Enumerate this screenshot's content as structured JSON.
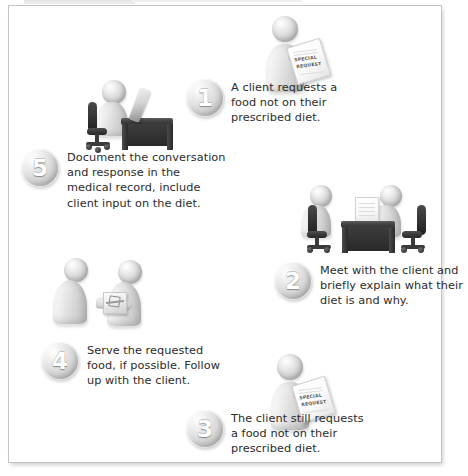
{
  "figure_tab": {
    "label": "",
    "visible_note": "partially cropped gray caption tab at top edge"
  },
  "diagram": {
    "type": "5-step cyclical process flow",
    "background_color": "#ffffff",
    "border_color": "#c4c4c4",
    "accent_color": "#b9b9b9",
    "text_color": "#2b2b2b",
    "steps": [
      {
        "number": "1",
        "text": "A client requests a food not on their prescribed diet.",
        "lines": [
          "A client requests a",
          "food not on their",
          "prescribed diet."
        ],
        "artwork": "standing-person-holding-special-request-note"
      },
      {
        "number": "2",
        "text": "Meet with the client and briefly explain what their diet is and why.",
        "lines": [
          "Meet with the client and",
          "briefly explain what their",
          "diet is and why."
        ],
        "artwork": "two-people-meeting-at-desk-with-papers"
      },
      {
        "number": "3",
        "text": "The client still requests a food not on their prescribed diet.",
        "lines": [
          "The client still requests",
          "a food not on their",
          "prescribed diet."
        ],
        "artwork": "standing-person-holding-special-request-note"
      },
      {
        "number": "4",
        "text": "Serve the requested food, if possible. Follow up with the client.",
        "lines": [
          "Serve the requested",
          "food, if possible. Follow",
          "up with the client."
        ],
        "artwork": "two-people-exchanging-food-tray"
      },
      {
        "number": "5",
        "text": "Document the conversation and response in the medical record, include client input on the diet.",
        "lines": [
          "Document the conversation",
          "and response in the",
          "medical record, include",
          "client input on the diet."
        ],
        "artwork": "person-at-desk-with-computer"
      }
    ],
    "note_label": {
      "line1": "SPECIAL",
      "line2": "REQUEST"
    }
  }
}
